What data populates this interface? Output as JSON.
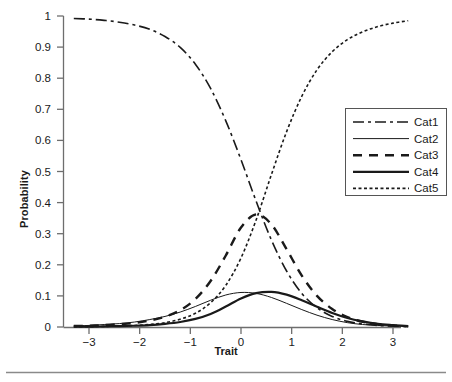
{
  "chart_data": {
    "type": "line",
    "title": "",
    "xlabel": "Trait",
    "ylabel": "Probability",
    "xlim": [
      -3.35,
      3.35
    ],
    "ylim": [
      0,
      1
    ],
    "xticks": [
      -3,
      -2,
      -1,
      0,
      1,
      2,
      3
    ],
    "xtick_labels": [
      "−3",
      "−2",
      "−1",
      "0",
      "1",
      "2",
      "3"
    ],
    "yticks": [
      0,
      0.1,
      0.2,
      0.3,
      0.4,
      0.5,
      0.6,
      0.7,
      0.8,
      0.9,
      1
    ],
    "ytick_labels": [
      "0",
      "0.1",
      "0.2",
      "0.3",
      "0.4",
      "0.5",
      "0.6",
      "0.7",
      "0.8",
      "0.9",
      "1"
    ],
    "grid": false,
    "legend_position": "right",
    "x": [
      -3.3,
      -3.0,
      -2.7,
      -2.4,
      -2.1,
      -1.8,
      -1.5,
      -1.2,
      -0.9,
      -0.6,
      -0.3,
      0.0,
      0.3,
      0.6,
      0.9,
      1.2,
      1.5,
      1.8,
      2.1,
      2.4,
      2.7,
      3.0,
      3.3
    ],
    "series": [
      {
        "name": "Cat1",
        "style": "dash-dot",
        "width": 1.6,
        "color": "#1a1a1a",
        "values": [
          0.992,
          0.99,
          0.986,
          0.98,
          0.971,
          0.957,
          0.934,
          0.899,
          0.845,
          0.767,
          0.663,
          0.538,
          0.404,
          0.28,
          0.18,
          0.108,
          0.062,
          0.034,
          0.018,
          0.01,
          0.005,
          0.003,
          0.001
        ]
      },
      {
        "name": "Cat2",
        "style": "solid-thin",
        "width": 1.0,
        "color": "#1a1a1a",
        "values": [
          0.004,
          0.005,
          0.008,
          0.011,
          0.016,
          0.024,
          0.034,
          0.048,
          0.066,
          0.086,
          0.103,
          0.111,
          0.108,
          0.095,
          0.076,
          0.056,
          0.038,
          0.024,
          0.014,
          0.008,
          0.005,
          0.003,
          0.001
        ]
      },
      {
        "name": "Cat3",
        "style": "dashed-thick",
        "width": 2.4,
        "color": "#1a1a1a",
        "values": [
          0.003,
          0.004,
          0.006,
          0.009,
          0.013,
          0.021,
          0.033,
          0.054,
          0.09,
          0.148,
          0.23,
          0.32,
          0.362,
          0.33,
          0.25,
          0.165,
          0.1,
          0.058,
          0.032,
          0.017,
          0.009,
          0.005,
          0.002
        ]
      },
      {
        "name": "Cat4",
        "style": "solid-thick",
        "width": 2.2,
        "color": "#1a1a1a",
        "values": [
          0.001,
          0.001,
          0.002,
          0.003,
          0.004,
          0.006,
          0.01,
          0.016,
          0.026,
          0.042,
          0.066,
          0.092,
          0.109,
          0.113,
          0.104,
          0.086,
          0.065,
          0.045,
          0.029,
          0.018,
          0.01,
          0.006,
          0.003
        ]
      },
      {
        "name": "Cat5",
        "style": "dotted",
        "width": 1.6,
        "color": "#1a1a1a",
        "values": [
          0.001,
          0.001,
          0.002,
          0.003,
          0.005,
          0.008,
          0.014,
          0.025,
          0.044,
          0.078,
          0.134,
          0.222,
          0.345,
          0.49,
          0.628,
          0.742,
          0.827,
          0.885,
          0.924,
          0.949,
          0.966,
          0.977,
          0.985
        ]
      }
    ]
  },
  "legend": {
    "entries": [
      "Cat1",
      "Cat2",
      "Cat3",
      "Cat4",
      "Cat5"
    ]
  }
}
